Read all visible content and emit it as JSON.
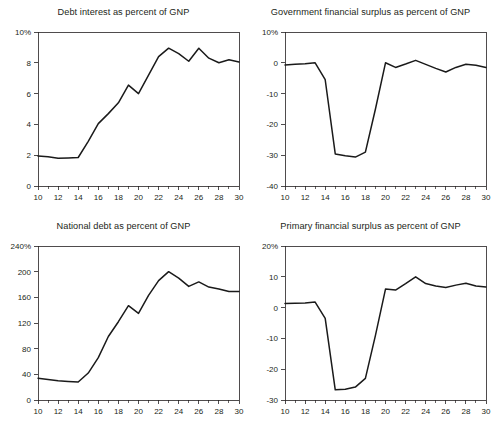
{
  "figure": {
    "width": 494,
    "height": 428,
    "background": "#ffffff",
    "line_color": "#1a1a1a",
    "text_color": "#231f20",
    "panel_count": 4
  },
  "chart_data": [
    {
      "id": "debt-interest",
      "type": "line",
      "title": "Debt interest as percent of GNP",
      "xlabel": "",
      "ylabel": "",
      "xlim": [
        10,
        30
      ],
      "ylim": [
        0,
        10
      ],
      "grid": false,
      "legend": "none",
      "x_ticks": [
        10,
        12,
        14,
        16,
        18,
        20,
        22,
        24,
        26,
        28,
        30
      ],
      "x_tick_labels": [
        "10",
        "12",
        "14",
        "16",
        "18",
        "20",
        "22",
        "24",
        "26",
        "28",
        "30"
      ],
      "x_minor_step": 1,
      "y_ticks": [
        0,
        2,
        4,
        6,
        8,
        10
      ],
      "y_tick_labels": [
        "0",
        "2",
        "4",
        "6",
        "8",
        "10%"
      ],
      "x": [
        10,
        11,
        12,
        13,
        14,
        15,
        16,
        17,
        18,
        19,
        20,
        21,
        22,
        23,
        24,
        25,
        26,
        27,
        28,
        29,
        30
      ],
      "values": [
        1.95,
        1.9,
        1.8,
        1.82,
        1.85,
        2.9,
        4.05,
        4.7,
        5.4,
        6.55,
        6.0,
        7.2,
        8.4,
        8.95,
        8.6,
        8.1,
        8.95,
        8.3,
        8.0,
        8.2,
        8.05
      ]
    },
    {
      "id": "government-financial-surplus",
      "type": "line",
      "title": "Government financial surplus as percent of GNP",
      "xlabel": "",
      "ylabel": "",
      "xlim": [
        10,
        30
      ],
      "ylim": [
        -40,
        10
      ],
      "grid": false,
      "legend": "none",
      "x_ticks": [
        10,
        12,
        14,
        16,
        18,
        20,
        22,
        24,
        26,
        28,
        30
      ],
      "x_tick_labels": [
        "10",
        "12",
        "14",
        "16",
        "18",
        "20",
        "22",
        "24",
        "26",
        "28",
        "30"
      ],
      "x_minor_step": 1,
      "y_ticks": [
        -40,
        -30,
        -20,
        -10,
        0,
        10
      ],
      "y_tick_labels": [
        "-40",
        "-30",
        "-20",
        "-10",
        "0",
        "10%"
      ],
      "x": [
        10,
        11,
        12,
        13,
        14,
        15,
        16,
        17,
        18,
        19,
        20,
        21,
        22,
        23,
        24,
        25,
        26,
        27,
        28,
        29,
        30
      ],
      "values": [
        -0.7,
        -0.5,
        -0.3,
        0.0,
        -5.5,
        -29.6,
        -30.2,
        -30.6,
        -29.0,
        -15.0,
        0.0,
        -1.5,
        -0.4,
        0.8,
        -0.5,
        -1.8,
        -3.0,
        -1.5,
        -0.5,
        -0.8,
        -1.5
      ]
    },
    {
      "id": "national-debt",
      "type": "line",
      "title": "National debt as percent of GNP",
      "xlabel": "",
      "ylabel": "",
      "xlim": [
        10,
        30
      ],
      "ylim": [
        0,
        240
      ],
      "grid": false,
      "legend": "none",
      "x_ticks": [
        10,
        12,
        14,
        16,
        18,
        20,
        22,
        24,
        26,
        28,
        30
      ],
      "x_tick_labels": [
        "10",
        "12",
        "14",
        "16",
        "18",
        "20",
        "22",
        "24",
        "26",
        "28",
        "30"
      ],
      "x_minor_step": 1,
      "y_ticks": [
        0,
        40,
        80,
        120,
        160,
        200,
        240
      ],
      "y_tick_labels": [
        "0",
        "40",
        "80",
        "120",
        "160",
        "200",
        "240%"
      ],
      "x": [
        10,
        11,
        12,
        13,
        14,
        15,
        16,
        17,
        18,
        19,
        20,
        21,
        22,
        23,
        24,
        25,
        26,
        27,
        28,
        29,
        30
      ],
      "values": [
        34,
        32,
        30,
        29,
        28,
        42,
        66,
        99,
        122,
        147,
        135,
        163,
        186,
        200,
        190,
        177,
        184,
        176,
        173,
        169,
        169
      ]
    },
    {
      "id": "primary-financial-surplus",
      "type": "line",
      "title": "Primary financial surplus as percent of GNP",
      "xlabel": "",
      "ylabel": "",
      "xlim": [
        10,
        30
      ],
      "ylim": [
        -30,
        20
      ],
      "grid": false,
      "legend": "none",
      "x_ticks": [
        10,
        12,
        14,
        16,
        18,
        20,
        22,
        24,
        26,
        28,
        30
      ],
      "x_tick_labels": [
        "10",
        "12",
        "14",
        "16",
        "18",
        "20",
        "22",
        "24",
        "26",
        "28",
        "30"
      ],
      "x_minor_step": 1,
      "y_ticks": [
        -30,
        -20,
        -10,
        0,
        10,
        20
      ],
      "y_tick_labels": [
        "-30",
        "-20",
        "-10",
        "0",
        "10",
        "20%"
      ],
      "x": [
        10,
        11,
        12,
        13,
        14,
        15,
        16,
        17,
        18,
        19,
        20,
        21,
        22,
        23,
        24,
        25,
        26,
        27,
        28,
        29,
        30
      ],
      "values": [
        1.3,
        1.4,
        1.5,
        1.8,
        -3.5,
        -26.7,
        -26.5,
        -25.8,
        -23.0,
        -9.0,
        6.0,
        5.7,
        7.8,
        10.0,
        7.8,
        7.0,
        6.5,
        7.3,
        7.9,
        7.0,
        6.7
      ]
    }
  ]
}
